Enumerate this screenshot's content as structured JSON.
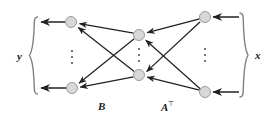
{
  "figure": {
    "kind": "bipartite-network-diagram",
    "width": 280,
    "height": 122,
    "background": "#ffffff"
  },
  "labels": {
    "left_group": "y",
    "right_group": "x",
    "left_matrix": "B",
    "right_matrix": "A",
    "right_matrix_superscript": "⊤"
  },
  "colors": {
    "node_fill": "#d8d8d8",
    "node_stroke": "#9a9a9a",
    "edge": "#222222",
    "brace": "#808080",
    "text": "#1a1a1a",
    "ellipsis": "#555555"
  },
  "nodes": [
    {
      "id": "y1",
      "label": "y-node-top",
      "cx": 71,
      "cy": 22,
      "r": 5.5
    },
    {
      "id": "yn",
      "label": "y-node-bottom",
      "cx": 72,
      "cy": 88,
      "r": 5.5
    },
    {
      "id": "m1",
      "label": "mid-node-top",
      "cx": 139,
      "cy": 35,
      "r": 5.5
    },
    {
      "id": "mn",
      "label": "mid-node-bottom",
      "cx": 139,
      "cy": 75,
      "r": 5.5
    },
    {
      "id": "x1",
      "label": "x-node-top",
      "cx": 205,
      "cy": 17,
      "r": 5.5
    },
    {
      "id": "xn",
      "label": "x-node-bottom",
      "cx": 205,
      "cy": 92,
      "r": 5.5
    }
  ],
  "ellipses": [
    {
      "id": "ell-left",
      "cx": 72,
      "cy": 57
    },
    {
      "id": "ell-mid",
      "cx": 139,
      "cy": 55
    },
    {
      "id": "ell-right",
      "cx": 205,
      "cy": 55
    }
  ],
  "edges": [
    {
      "from": "m1",
      "to": "y1",
      "name": "edge-mid-top-to-y-top"
    },
    {
      "from": "mn",
      "to": "y1",
      "name": "edge-mid-bottom-to-y-top"
    },
    {
      "from": "m1",
      "to": "yn",
      "name": "edge-mid-top-to-y-bottom"
    },
    {
      "from": "mn",
      "to": "yn",
      "name": "edge-mid-bottom-to-y-bottom"
    },
    {
      "from": "x1",
      "to": "m1",
      "name": "edge-x-top-to-mid-top"
    },
    {
      "from": "x1",
      "to": "mn",
      "name": "edge-x-top-to-mid-bottom"
    },
    {
      "from": "xn",
      "to": "m1",
      "name": "edge-x-bottom-to-mid-top"
    },
    {
      "from": "xn",
      "to": "mn",
      "name": "edge-x-bottom-to-mid-bottom"
    }
  ],
  "output_arrows": [
    {
      "name": "output-arrow-y-top",
      "from_x": 65,
      "to_x": 40,
      "y": 22
    },
    {
      "name": "output-arrow-y-bottom",
      "from_x": 66,
      "to_x": 40,
      "y": 88
    }
  ],
  "input_arrows": [
    {
      "name": "input-arrow-x-top",
      "from_x": 238,
      "to_x": 213,
      "y": 17
    },
    {
      "name": "input-arrow-x-bottom",
      "from_x": 238,
      "to_x": 213,
      "y": 92
    }
  ],
  "braces": [
    {
      "name": "brace-left",
      "x": 33,
      "top": 18,
      "bottom": 93,
      "direction": "right"
    },
    {
      "name": "brace-right",
      "x": 243,
      "top": 14,
      "bottom": 96,
      "direction": "left"
    }
  ]
}
